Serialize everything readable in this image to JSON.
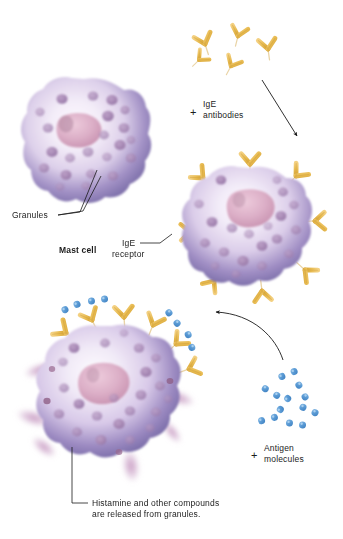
{
  "figure": {
    "background_color": "#ffffff"
  },
  "labels": {
    "granules": "Granules",
    "mast_cell": "Mast cell",
    "ige_antibodies_line1": "IgE",
    "ige_antibodies_line2": "antibodies",
    "ige_receptor_line1": "IgE",
    "ige_receptor_line2": "receptor",
    "antigen_line1": "Antigen",
    "antigen_line2": "molecules",
    "histamine_line1": "Histamine and other compounds",
    "histamine_line2": "are released from granules.",
    "plus_antibodies": "+",
    "plus_antigen": "+"
  },
  "colors": {
    "cell_rim": "#8577b0",
    "cell_rim_dark": "#6f619e",
    "cytoplasm": "#ece4f3",
    "cytoplasm_light": "#f7f2fa",
    "granule": "#a889b5",
    "granule_dark": "#9a76aa",
    "nucleus": "#d9a8c0",
    "nucleus_edge": "#c68fae",
    "antibody_yellow": "#e9bd55",
    "antibody_yellow_dark": "#d9a838",
    "antigen_blue": "#5b9bd5",
    "antigen_blue_dark": "#3f84c4",
    "histamine_plume": "#c49ac0",
    "leader_line": "#1a1a1a",
    "arrow": "#1a1a1a"
  },
  "cells": [
    {
      "name": "mast-cell-resting",
      "stage": 1,
      "cx": 84,
      "cy": 143,
      "r": 64,
      "has_receptors": false,
      "has_antigens": false,
      "releasing": false,
      "granule_count": 22
    },
    {
      "name": "mast-cell-sensitized",
      "stage": 2,
      "cx": 250,
      "cy": 228,
      "r": 60,
      "has_receptors": true,
      "has_antigens": false,
      "releasing": false,
      "granule_count": 20,
      "receptor_count": 8
    },
    {
      "name": "mast-cell-degranulating",
      "stage": 3,
      "cx": 112,
      "cy": 393,
      "r": 67,
      "has_receptors": true,
      "has_antigens": true,
      "releasing": true,
      "granule_count": 22,
      "receptor_count": 6,
      "plume_count": 6
    }
  ],
  "free_antibodies": [
    {
      "x": 205,
      "y": 44,
      "rot": -18,
      "scale": 1.0
    },
    {
      "x": 238,
      "y": 36,
      "rot": 14,
      "scale": 0.95
    },
    {
      "x": 268,
      "y": 49,
      "rot": -8,
      "scale": 1.0
    },
    {
      "x": 231,
      "y": 66,
      "rot": 28,
      "scale": 0.9
    },
    {
      "x": 199,
      "y": 60,
      "rot": 46,
      "scale": 0.82
    }
  ],
  "free_antigens": [
    {
      "x": 288,
      "y": 374,
      "rot": -22
    },
    {
      "x": 271,
      "y": 392,
      "rot": 30
    },
    {
      "x": 302,
      "y": 391,
      "rot": 62
    },
    {
      "x": 284,
      "y": 404,
      "rot": -56
    },
    {
      "x": 309,
      "y": 410,
      "rot": 24
    },
    {
      "x": 268,
      "y": 419,
      "rot": -14
    },
    {
      "x": 296,
      "y": 424,
      "rot": 8
    }
  ],
  "arrows": [
    {
      "name": "antibodies-to-cell-arrow",
      "type": "straight",
      "x1": 262,
      "y1": 80,
      "x2": 298,
      "y2": 137
    },
    {
      "name": "antigens-to-cell-arrow",
      "type": "curved",
      "x1": 283,
      "y1": 360,
      "x2": 213,
      "y2": 313
    }
  ],
  "leaders": [
    {
      "name": "granules-leader",
      "points": "58,215 76,212 95,172"
    },
    {
      "name": "granules-leader-2",
      "points": "62,214 80,210 98,178"
    },
    {
      "name": "ige-receptor-leader",
      "points": "173,246 186,241 200,231"
    },
    {
      "name": "histamine-leader",
      "points": "68,444 81,494 88,503"
    }
  ]
}
